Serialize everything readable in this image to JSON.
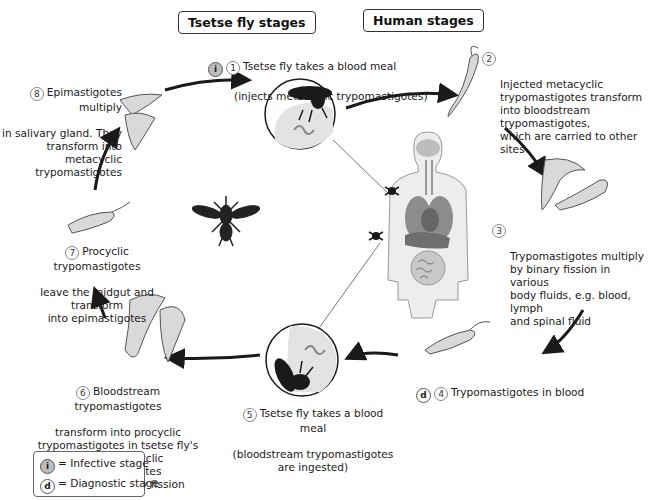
{
  "headers": {
    "tsetse": "Tsetse fly stages",
    "human": "Human stages"
  },
  "stages": [
    {
      "num": "1",
      "badge": "i",
      "line1": "Tsetse fly takes a blood meal",
      "line2": "(injects metacyclic trypomastigotes)"
    },
    {
      "num": "2",
      "text": "Injected metacyclic\ntrypomastigotes transform\ninto bloodstream trypomastigotes,\nwhich are carried to other sites"
    },
    {
      "num": "3",
      "text": "Trypomastigotes multiply\nby binary fission in various\nbody fluids, e.g. blood, lymph\nand spinal fluid"
    },
    {
      "num": "4",
      "badge": "d",
      "text": "Trypomastigotes in blood"
    },
    {
      "num": "5",
      "line1": "Tsetse fly takes a blood meal",
      "line2": "(bloodstream trypomastigotes\nare ingested)"
    },
    {
      "num": "6",
      "line1": "Bloodstream trypomastigotes",
      "line2": "transform into procyclic\ntrypomastigotes in tsetse fly's\nmidgut. Procyclic trypomastigotes\nmultiply by binary fission"
    },
    {
      "num": "7",
      "line1": "Procyclic trypomastigotes",
      "line2": "leave the midgut and transform\ninto epimastigotes"
    },
    {
      "num": "8",
      "line1": "Epimastigotes multiply",
      "line2": "in salivary gland. They\ntransform into metacyclic\ntrypomastigotes"
    }
  ],
  "legend": {
    "infective_badge": "i",
    "infective_label": "= Infective stage",
    "diagnostic_badge": "d",
    "diagnostic_label": "= Diagnostic stage"
  },
  "colors": {
    "line": "#1a1a1a",
    "parasite_fill": "#d9d9d9",
    "organ_dark": "#8c8c8c",
    "organ_light": "#c8c8c8",
    "body_fill": "#ededed"
  }
}
